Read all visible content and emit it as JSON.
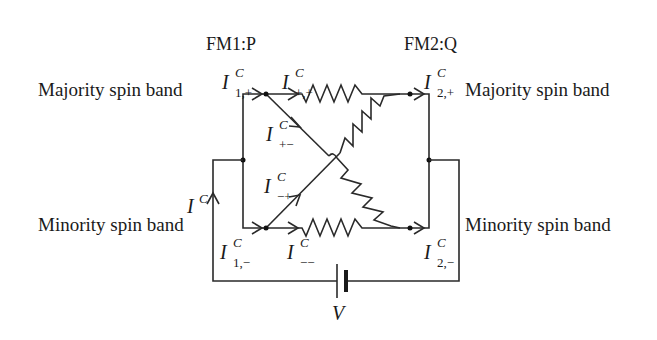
{
  "layer_labels": {
    "fm1": "FM1:P",
    "fm2": "FM2:Q"
  },
  "band_labels": {
    "left_majority": "Majority spin band",
    "right_majority": "Majority spin band",
    "left_minority": "Minority spin band",
    "right_minority": "Minority spin band"
  },
  "currents": {
    "i1_plus": {
      "main": "I",
      "sup": "C",
      "sub": "1,+"
    },
    "i_plus_plus": {
      "main": "I",
      "sup": "C",
      "sub": "+,+"
    },
    "i2_plus": {
      "main": "I",
      "sup": "C",
      "sub": "2,+"
    },
    "i_plus_minus": {
      "main": "I",
      "sup": "C",
      "sub": "+−"
    },
    "i_minus_plus": {
      "main": "I",
      "sup": "C",
      "sub": "−+"
    },
    "i1_minus": {
      "main": "I",
      "sup": "C",
      "sub": "1,−"
    },
    "i_minus_minus": {
      "main": "I",
      "sup": "C",
      "sub": "−−"
    },
    "i2_minus": {
      "main": "I",
      "sup": "C",
      "sub": "2,−"
    },
    "i_total": {
      "main": "I",
      "sup": "C"
    }
  },
  "battery": {
    "label": "V"
  },
  "colors": {
    "line": "#2a2a2a",
    "text": "#1a1a1a",
    "background": "#ffffff"
  }
}
